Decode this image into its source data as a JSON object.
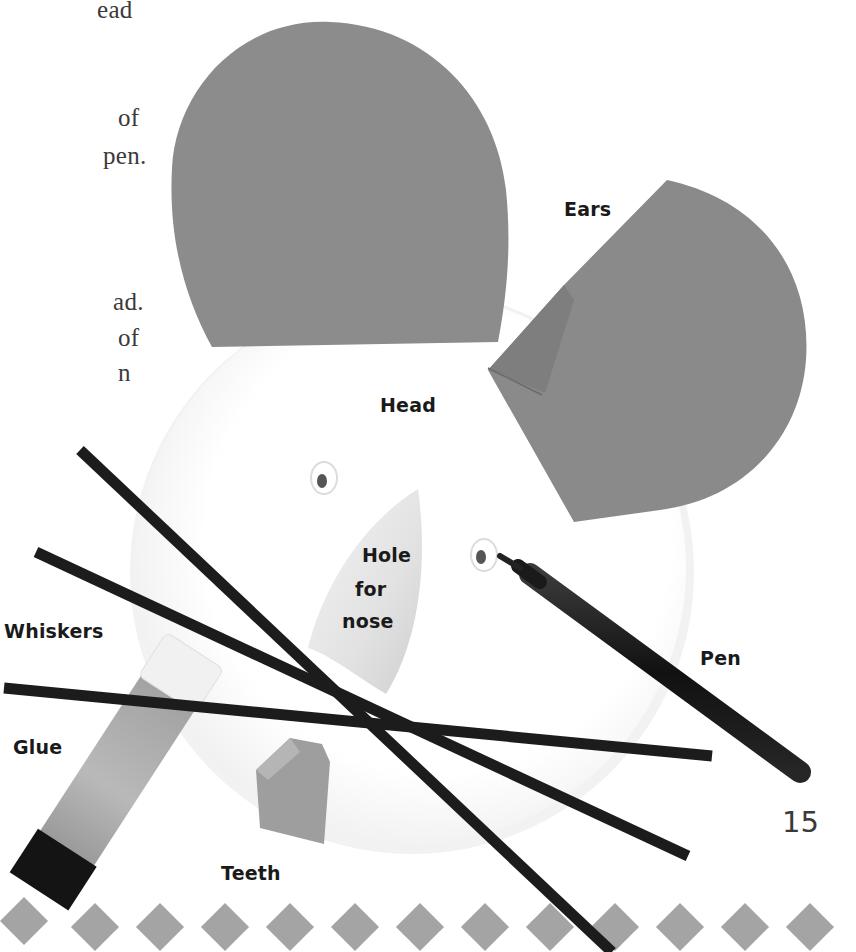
{
  "page": {
    "page_number": "15",
    "left_column_fragments": [
      {
        "text": "ead",
        "x": 0,
        "y": -6
      },
      {
        "text": "of",
        "x": 0,
        "y": 102
      },
      {
        "text": "pen.",
        "x": 0,
        "y": 140
      },
      {
        "text": "ad.",
        "x": 0,
        "y": 286
      },
      {
        "text": "of",
        "x": 0,
        "y": 322
      },
      {
        "text": "n",
        "x": 0,
        "y": 357
      }
    ]
  },
  "labels": {
    "ears": "Ears",
    "head": "Head",
    "hole_line1": "Hole",
    "hole_line2": "for",
    "hole_line3": "nose",
    "whiskers": "Whiskers",
    "pen": "Pen",
    "glue": "Glue",
    "teeth": "Teeth"
  },
  "colors": {
    "card_grey": "#8a8a8a",
    "whisker_black": "#1c1c1c",
    "diamond_grey": "#a3a3a3",
    "text": "#1a1a1a"
  },
  "decorative_border": {
    "shape": "diamond",
    "count": 13
  }
}
